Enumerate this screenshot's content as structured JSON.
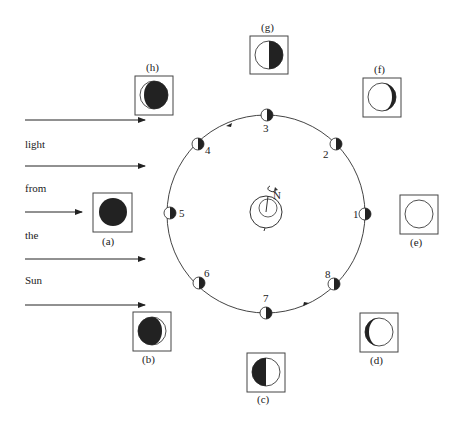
{
  "diagram": {
    "sunlight_text": [
      "light",
      "from",
      "the",
      "Sun"
    ],
    "earth": {
      "rotation_label": "N"
    },
    "orbit_positions": [
      {
        "n": "1",
        "label": "1"
      },
      {
        "n": "2",
        "label": "2"
      },
      {
        "n": "3",
        "label": "3"
      },
      {
        "n": "4",
        "label": "4"
      },
      {
        "n": "5",
        "label": "5"
      },
      {
        "n": "6",
        "label": "6"
      },
      {
        "n": "7",
        "label": "7"
      },
      {
        "n": "8",
        "label": "8"
      }
    ],
    "phase_views": [
      {
        "id": "a",
        "label": "(a)",
        "phase": "new moon"
      },
      {
        "id": "b",
        "label": "(b)",
        "phase": "waxing crescent"
      },
      {
        "id": "c",
        "label": "(c)",
        "phase": "first quarter"
      },
      {
        "id": "d",
        "label": "(d)",
        "phase": "waxing gibbous"
      },
      {
        "id": "e",
        "label": "(e)",
        "phase": "full moon"
      },
      {
        "id": "f",
        "label": "(f)",
        "phase": "waning gibbous"
      },
      {
        "id": "g",
        "label": "(g)",
        "phase": "third quarter"
      },
      {
        "id": "h",
        "label": "(h)",
        "phase": "waning crescent"
      }
    ],
    "colors": {
      "ink": "#222222",
      "background": "#ffffff"
    }
  }
}
